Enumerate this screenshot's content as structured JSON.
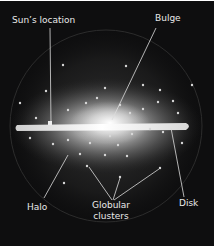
{
  "diagram": {
    "labels": {
      "sun_location": "Sun’s location",
      "bulge": "Bulge",
      "halo": "Halo",
      "globular_line1": "Globular",
      "globular_line2": "clusters",
      "disk": "Disk"
    },
    "colors": {
      "background": "#0e0e0f",
      "disk": "#f4f2ec",
      "glow": "#d8d8d8",
      "label_text": "#e9e9e9",
      "leader_line": "#dcdcdc"
    }
  }
}
